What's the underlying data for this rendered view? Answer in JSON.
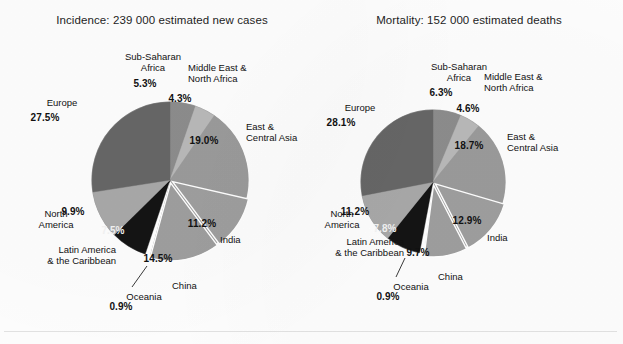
{
  "figure": {
    "background_color": "#fdfdfd",
    "text_color": "#111111",
    "separator_color": "#ffffff"
  },
  "chart_data": [
    {
      "type": "pie",
      "id": "incidence",
      "title": "Incidence: 239 000 estimated new cases",
      "total_label": "239 000 estimated new cases",
      "start_angle_deg": 0,
      "direction": "clockwise",
      "center": [
        170,
        180
      ],
      "radius": 78,
      "categories": [
        "Sub-Saharan Africa",
        "Middle East & North Africa",
        "East & Central Asia",
        "India",
        "China",
        "Oceania",
        "Latin America & the Caribbean",
        "North America",
        "Europe"
      ],
      "values": [
        5.3,
        4.3,
        19.0,
        11.2,
        14.5,
        0.9,
        7.5,
        9.9,
        27.5
      ],
      "value_labels": [
        "5.3%",
        "4.3%",
        "19.0%",
        "11.2%",
        "14.5%",
        "0.9%",
        "7.5%",
        "9.9%",
        "27.5%"
      ],
      "colors": [
        "#8c8c8c",
        "#b8b8b8",
        "#9a9a9a",
        "#9e9e9e",
        "#9e9e9e",
        "#ffffff",
        "#141414",
        "#a8a8a8",
        "#666666"
      ],
      "exploded": [
        false,
        false,
        false,
        true,
        true,
        true,
        false,
        false,
        false
      ],
      "labels_detail": [
        {
          "name": "Sub-Saharan Africa",
          "text": "Sub-Saharan\nAfrica",
          "pct": "5.3%"
        },
        {
          "name": "Middle East & North Africa",
          "text": "Middle East &\nNorth Africa",
          "pct": "4.3%"
        },
        {
          "name": "East & Central Asia",
          "text": "East &\nCentral Asia",
          "pct": "19.0%"
        },
        {
          "name": "India",
          "text": "India",
          "pct": "11.2%"
        },
        {
          "name": "China",
          "text": "China",
          "pct": "14.5%"
        },
        {
          "name": "Oceania",
          "text": "Oceania",
          "pct": "0.9%"
        },
        {
          "name": "Latin America & the Caribbean",
          "text": "Latin America\n& the Caribbean",
          "pct": "7.5%"
        },
        {
          "name": "North America",
          "text": "North\nAmerica",
          "pct": "9.9%"
        },
        {
          "name": "Europe",
          "text": "Europe",
          "pct": "27.5%"
        }
      ]
    },
    {
      "type": "pie",
      "id": "mortality",
      "title": "Mortality: 152 000 estimated deaths",
      "total_label": "152 000 estimated deaths",
      "start_angle_deg": 0,
      "direction": "clockwise",
      "center": [
        433,
        182
      ],
      "radius": 72,
      "categories": [
        "Sub-Saharan Africa",
        "Middle East & North Africa",
        "East & Central Asia",
        "India",
        "China",
        "Oceania",
        "Latin America & the Caribbean",
        "North America",
        "Europe"
      ],
      "values": [
        6.3,
        4.6,
        18.7,
        12.9,
        9.7,
        0.9,
        7.8,
        11.2,
        28.1
      ],
      "value_labels": [
        "6.3%",
        "4.6%",
        "18.7%",
        "12.9%",
        "9.7%",
        "0.9%",
        "7.8%",
        "11.2%",
        "28.1%"
      ],
      "colors": [
        "#8c8c8c",
        "#b8b8b8",
        "#9a9a9a",
        "#9e9e9e",
        "#9e9e9e",
        "#ffffff",
        "#141414",
        "#a8a8a8",
        "#666666"
      ],
      "exploded": [
        false,
        false,
        false,
        true,
        true,
        true,
        false,
        false,
        false
      ],
      "labels_detail": [
        {
          "name": "Sub-Saharan Africa",
          "text": "Sub-Saharan\nAfrica",
          "pct": "6.3%"
        },
        {
          "name": "Middle East & North Africa",
          "text": "Middle East &\nNorth Africa",
          "pct": "4.6%"
        },
        {
          "name": "East & Central Asia",
          "text": "East &\nCentral Asia",
          "pct": "18.7%"
        },
        {
          "name": "India",
          "text": "India",
          "pct": "12.9%"
        },
        {
          "name": "China",
          "text": "China",
          "pct": "9.7%"
        },
        {
          "name": "Oceania",
          "text": "Oceania",
          "pct": "0.9%"
        },
        {
          "name": "Latin America & the Caribbean",
          "text": "Latin America\n& the Caribbean",
          "pct": "7.8%"
        },
        {
          "name": "North America",
          "text": "North\nAmerica",
          "pct": "11.2%"
        },
        {
          "name": "Europe",
          "text": "Europe",
          "pct": "28.1%"
        }
      ]
    }
  ],
  "left": {
    "title": "Incidence: 239 000 estimated new cases",
    "annotations": {
      "sub_saharan_name": "Sub-Saharan\nAfrica",
      "sub_saharan_pct": "5.3%",
      "mena_name": "Middle East &\nNorth Africa",
      "mena_pct": "4.3%",
      "east_central_asia_name": "East &\nCentral Asia",
      "east_central_asia_pct": "19.0%",
      "india_name": "India",
      "india_pct": "11.2%",
      "china_name": "China",
      "china_pct": "14.5%",
      "oceania_name": "Oceania",
      "oceania_pct": "0.9%",
      "latam_name": "Latin America\n& the Caribbean",
      "latam_pct": "7.5%",
      "north_america_name": "North\nAmerica",
      "north_america_pct": "9.9%",
      "europe_name": "Europe",
      "europe_pct": "27.5%"
    }
  },
  "right": {
    "title": "Mortality: 152 000 estimated deaths",
    "annotations": {
      "sub_saharan_name": "Sub-Saharan\nAfrica",
      "sub_saharan_pct": "6.3%",
      "mena_name": "Middle East &\nNorth Africa",
      "mena_pct": "4.6%",
      "east_central_asia_name": "East &\nCentral Asia",
      "east_central_asia_pct": "18.7%",
      "india_name": "India",
      "india_pct": "12.9%",
      "china_name": "China",
      "china_pct": "9.7%",
      "oceania_name": "Oceania",
      "oceania_pct": "0.9%",
      "latam_name": "Latin America\n& the Caribbean",
      "latam_pct": "7.8%",
      "north_america_name": "North\nAmerica",
      "north_america_pct": "11.2%",
      "europe_name": "Europe",
      "europe_pct": "28.1%"
    }
  }
}
